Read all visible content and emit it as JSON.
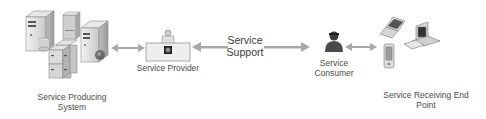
{
  "diagram": {
    "nodes": [
      {
        "id": "producing",
        "label_line1": "Service Producing",
        "label_line2": "System",
        "icon": "server-cluster-icon"
      },
      {
        "id": "provider",
        "label": "Service Provider",
        "icon": "service-provider-desk-icon"
      },
      {
        "id": "consumer",
        "label_line1": "Service",
        "label_line2": "Consumer",
        "icon": "person-icon"
      },
      {
        "id": "endpoint",
        "label_line1": "Service Receiving End",
        "label_line2": "Point",
        "icon": "devices-icon"
      }
    ],
    "edges": [
      {
        "from": "producing",
        "to": "provider",
        "type": "bidirectional"
      },
      {
        "from": "provider",
        "to": "consumer",
        "type": "bidirectional",
        "label_line1": "Service",
        "label_line2": "Support"
      },
      {
        "from": "consumer",
        "to": "endpoint",
        "type": "bidirectional"
      }
    ],
    "colors": {
      "arrow": "#a8a8a8",
      "icon_fill": "#d8d8d8",
      "icon_stroke": "#8a8a8a",
      "text": "#4a4a4a"
    }
  }
}
